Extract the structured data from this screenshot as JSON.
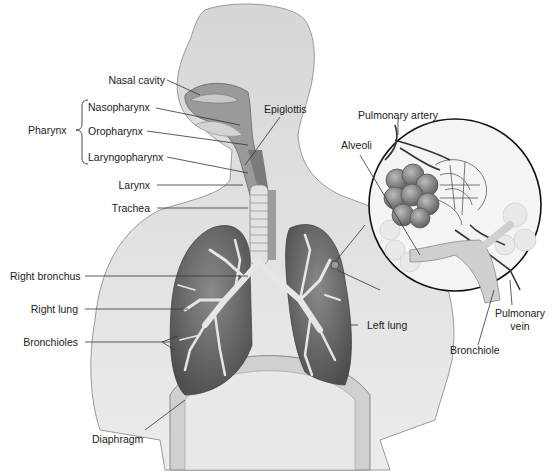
{
  "diagram": {
    "colors": {
      "background": "#ffffff",
      "body_fill": "#dcdcdc",
      "body_stroke": "#9a9a9a",
      "lung_fill": "#6e6e6e",
      "bronchi_fill": "#e6e6e6",
      "leader_line": "#333333",
      "inset_circle": "#111111",
      "label_text": "#222222"
    },
    "labels": {
      "nasal_cavity": "Nasal cavity",
      "nasopharynx": "Nasopharynx",
      "pharynx": "Pharynx",
      "oropharynx": "Oropharynx",
      "laryngopharynx": "Laryngopharynx",
      "epiglottis": "Epiglottis",
      "larynx": "Larynx",
      "trachea": "Trachea",
      "pulmonary_artery": "Pulmonary artery",
      "alveoli": "Alveoli",
      "right_bronchus": "Right bronchus",
      "right_lung": "Right lung",
      "bronchioles": "Bronchioles",
      "left_lung": "Left lung",
      "pulmonary_vein_line1": "Pulmonary",
      "pulmonary_vein_line2": "vein",
      "bronchiole": "Bronchiole",
      "diaphragm": "Diaphragm"
    }
  }
}
